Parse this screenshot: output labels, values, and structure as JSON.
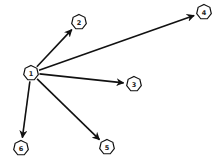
{
  "diagram": {
    "type": "directed-graph",
    "nodes": [
      {
        "id": "1",
        "label": "1"
      },
      {
        "id": "2",
        "label": "2"
      },
      {
        "id": "3",
        "label": "3"
      },
      {
        "id": "4",
        "label": "4"
      },
      {
        "id": "5",
        "label": "5"
      },
      {
        "id": "6",
        "label": "6"
      }
    ],
    "edges": [
      {
        "from": "1",
        "to": "2"
      },
      {
        "from": "1",
        "to": "4"
      },
      {
        "from": "1",
        "to": "3"
      },
      {
        "from": "1",
        "to": "5"
      },
      {
        "from": "1",
        "to": "6"
      }
    ],
    "colors": {
      "stroke": "#111111",
      "node_fill": "#ffffff",
      "label": "#222222"
    }
  }
}
